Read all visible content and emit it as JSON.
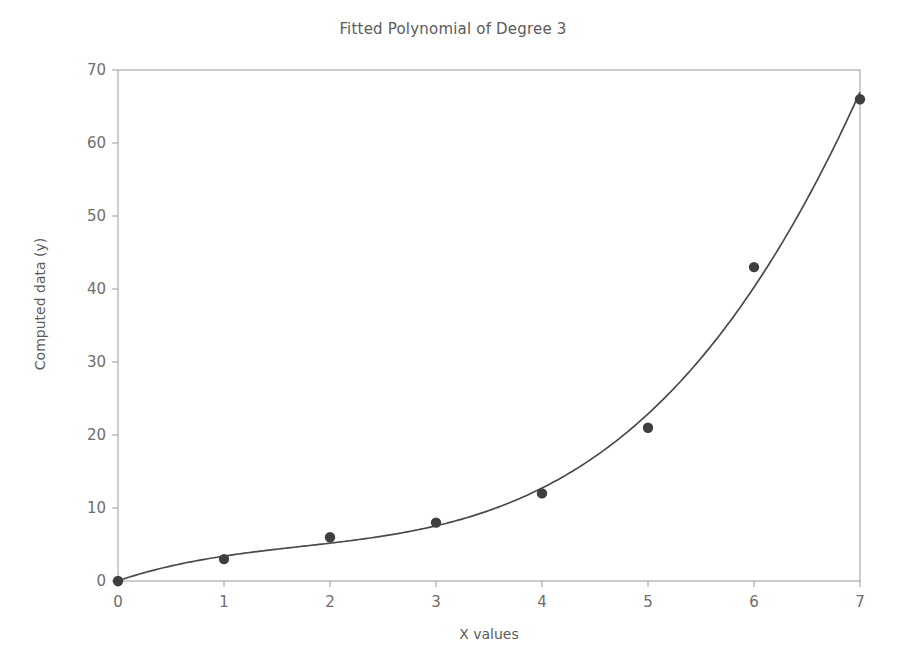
{
  "chart_data": {
    "type": "scatter",
    "title": "Fitted Polynomial of Degree 3",
    "xlabel": "X values",
    "ylabel": "Computed data (y)",
    "xlim": [
      0,
      7
    ],
    "ylim": [
      0,
      70
    ],
    "xticks": [
      "0",
      "1",
      "2",
      "3",
      "4",
      "5",
      "6",
      "7"
    ],
    "yticks": [
      "0",
      "10",
      "20",
      "30",
      "40",
      "50",
      "60",
      "70"
    ],
    "xtick_values": [
      0,
      1,
      2,
      3,
      4,
      5,
      6,
      7
    ],
    "ytick_values": [
      0,
      10,
      20,
      30,
      40,
      50,
      60,
      70
    ],
    "grid": false,
    "legend": null,
    "series": [
      {
        "name": "data points",
        "kind": "scatter",
        "marker": "circle",
        "color": "#3f3f3f",
        "x": [
          0,
          1,
          2,
          3,
          4,
          5,
          6,
          7
        ],
        "y": [
          0,
          3,
          6,
          8,
          12,
          21,
          43,
          66
        ]
      },
      {
        "name": "fitted polynomial degree 3",
        "kind": "line",
        "color": "#4a4a4a",
        "x": [
          0,
          1,
          2,
          3,
          4,
          5,
          6,
          7
        ],
        "y": [
          0,
          3.1,
          5.6,
          8.4,
          13.1,
          21.4,
          35.0,
          66.0
        ]
      }
    ]
  },
  "figure": {
    "background_color": "#ffffff",
    "axis_color": "#9a9a9a",
    "text_color": "#5b5b5b"
  }
}
